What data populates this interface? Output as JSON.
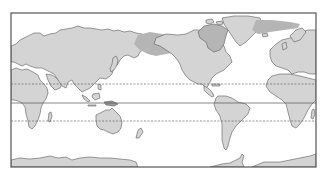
{
  "map": {
    "type": "world-map",
    "projection": "equirectangular-like, centered on Pacific (Africa/Europe at both edges)",
    "colors": {
      "background": "#ffffff",
      "ocean": "#ffffff",
      "land": "#d4d4d4",
      "land_outline": "#5a5a5a",
      "highlight_region": "#b5b5b5",
      "frame": "#555555",
      "latitude_lines": "#555555"
    },
    "latitude_lines": [
      {
        "name": "Tropic of Cancer",
        "style": "dashed",
        "y": 84
      },
      {
        "name": "Equator",
        "style": "solid",
        "y": 103
      },
      {
        "name": "Tropic of Capricorn",
        "style": "dashed",
        "y": 121
      }
    ],
    "highlighted_regions": [
      "Arctic band across northern Siberia / Bering region",
      "Canadian Arctic Archipelago and Greenland east coast band"
    ],
    "landmasses": [
      "Africa",
      "Europe",
      "Asia",
      "Australia",
      "New Zealand",
      "North America",
      "Greenland",
      "South America",
      "Antarctica"
    ]
  }
}
